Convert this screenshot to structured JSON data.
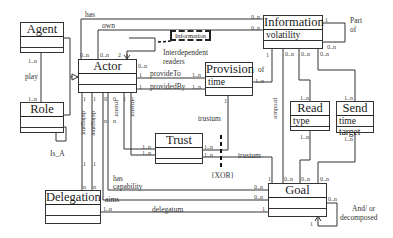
{
  "classes": {
    "agent": {
      "name": "Agent",
      "attributes": []
    },
    "role": {
      "name": "Role",
      "attributes": []
    },
    "actor": {
      "name": "Actor",
      "attributes": []
    },
    "provision": {
      "name": "Provision",
      "attributes": [
        "time"
      ]
    },
    "information": {
      "name": "Information",
      "attributes": [
        "volatility"
      ]
    },
    "read": {
      "name": "Read",
      "attributes": [
        "type"
      ]
    },
    "send": {
      "name": "Send",
      "attributes": [
        "time",
        "target"
      ]
    },
    "trust": {
      "name": "Trust",
      "attributes": []
    },
    "goal": {
      "name": "Goal",
      "attributes": []
    },
    "delegation": {
      "name": "Delegation",
      "attributes": []
    }
  },
  "associations": {
    "has": "has",
    "own": "own",
    "play": "play",
    "is_a": "Is_A",
    "interdependent_readers": [
      "Interdependent",
      "readers"
    ],
    "information_tag": "Information",
    "provide_to": "provideTo",
    "provided_by": "providedBy",
    "of": "of",
    "part_of": [
      "Part",
      "of"
    ],
    "produce": "produce",
    "trustum_top": "trustum",
    "trustum_bottom": "trustum",
    "xor": "{XOR}",
    "delegator": "delegator",
    "delegatee": "delegatee",
    "trustor_1": "trustor",
    "trustor_2": "trustor",
    "has_capability": [
      "has",
      "capability"
    ],
    "aims": "aims",
    "delegatum": "delegatum",
    "and_or_decomposed": [
      "And/ or",
      "decomposed"
    ]
  },
  "multiplicities": {
    "agent_play": "1..n",
    "role_play": "1..n",
    "actor_has": "0..n",
    "actor_own": "0..n",
    "actor_self": "2",
    "actor_self_b": "0..n",
    "actor_provideTo": "1",
    "actor_providedBy": "1",
    "provision_provideTo": "1..n",
    "provision_providedBy": "1..n",
    "provision_of": "1..n",
    "information_of": "1",
    "information_has": "0..n",
    "information_own": "0..n",
    "information_part_1": "1",
    "information_part_n": "0..n",
    "information_produce": "0..n",
    "information_read": "0..n",
    "information_send": "0..n",
    "read_top": "1..n",
    "read_bottom": "1..n",
    "send_top": "1..n",
    "send_bottom": "1..n",
    "provision_trust": "1",
    "trust_a": "1..n",
    "trust_b": "1..n",
    "trust_c": "1..n",
    "trust_d": "1..n",
    "actor_delegator": "1",
    "actor_delegatee": "1",
    "actor_cap": "0",
    "actor_aims": "0",
    "actor_trustor1": "1",
    "actor_trustor2": "1",
    "deleg_delegator": "1",
    "deleg_delegatee": "1",
    "deleg_n1": "n",
    "deleg_n2": "n",
    "actor_cap_n": "n",
    "actor_aims_n": "n",
    "deleg_delegatum": "1..n",
    "goal_trustum": "1",
    "goal_produce": "0..n",
    "goal_read": "0..n",
    "goal_send": "0..n",
    "goal_cap": "0..n",
    "goal_aims": "0..n",
    "goal_delegatum": "1",
    "goal_decomp_n": "0..n",
    "goal_decomp_1": "1"
  }
}
